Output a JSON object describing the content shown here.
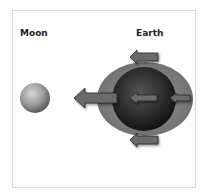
{
  "diagram": {
    "labels": {
      "moon": "Moon",
      "earth": "Earth"
    },
    "colors": {
      "frame_border": "#d6d6d6",
      "tidal_bulge": "#7a7a7a",
      "earth_dark": "#1e1e1e",
      "moon_gray": "#9a9a9a",
      "arrow_fill": "#6b6b6b",
      "arrow_stroke": "#2a2a2a"
    },
    "arrows": [
      {
        "name": "arrow-top",
        "direction": "left"
      },
      {
        "name": "arrow-gravity-large",
        "direction": "left"
      },
      {
        "name": "arrow-earth-center",
        "direction": "left"
      },
      {
        "name": "arrow-far-side",
        "direction": "left"
      },
      {
        "name": "arrow-bottom",
        "direction": "left"
      }
    ]
  }
}
